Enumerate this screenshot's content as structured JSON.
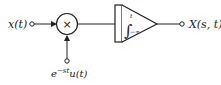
{
  "diagram": {
    "input_label": "x(t)",
    "multiplier_symbol": "×",
    "kernel_label_base": "e",
    "kernel_label_exp": "−st",
    "kernel_label_tail": "u(t)",
    "integrator_upper_limit": "t",
    "integrator_lower_limit": "−∞",
    "integrator_symbol": "∫",
    "output_label": "X(s, t)",
    "line_color": "#222222"
  }
}
